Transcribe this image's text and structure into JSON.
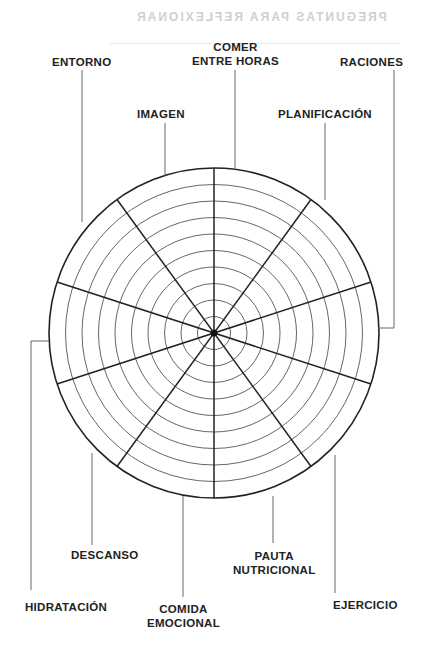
{
  "background_text": "PREGUNTAS PARA REFLEXIONAR",
  "wheel": {
    "rings": 10,
    "sectors": 10,
    "center": [
      214,
      333
    ],
    "radius": 165
  },
  "labels": {
    "entorno": "ENTORNO",
    "comer_1": "COMER",
    "comer_2": "ENTRE HORAS",
    "raciones": "RACIONES",
    "imagen": "IMAGEN",
    "planificacion": "PLANIFICACIÓN",
    "hidratacion": "HIDRATACIÓN",
    "descanso": "DESCANSO",
    "comida_1": "COMIDA",
    "comida_2": "EMOCIONAL",
    "pauta_1": "PAUTA",
    "pauta_2": "NUTRICIONAL",
    "ejercicio": "EJERCICIO"
  }
}
